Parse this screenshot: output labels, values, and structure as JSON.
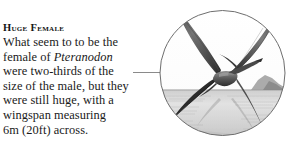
{
  "page": {
    "background_color": "#ffffff",
    "width": 287,
    "height": 150
  },
  "caption": {
    "heading": "Huge Female",
    "lines": [
      {
        "pre": "What seem to to be the",
        "species": "",
        "post": ""
      },
      {
        "pre": "female of ",
        "species": "Pteranodon",
        "post": ""
      },
      {
        "pre": "were two-thirds of the",
        "species": "",
        "post": ""
      },
      {
        "pre": "size of the male, but they",
        "species": "",
        "post": ""
      },
      {
        "pre": "were still huge, with a",
        "species": "",
        "post": ""
      },
      {
        "pre": "wingspan measuring",
        "species": "",
        "post": ""
      },
      {
        "pre": "6m (20ft) across.",
        "species": "",
        "post": ""
      }
    ],
    "full_text": "What seem to to be the female of Pteranodon were two-thirds of the size of the male, but they were still huge, with a wingspan measuring 6m (20ft) across.",
    "text_color": "#1a1a1a",
    "heading_color": "#141414"
  },
  "leader_line": {
    "color": "#8a8a8a"
  },
  "illustration": {
    "subject": "pteranodon-in-flight",
    "style": "grayscale-engraving-vignette",
    "shape": "circle",
    "scene_elements": [
      "pteranodon-gliding",
      "sea-surface",
      "horizon-line",
      "distant-headland",
      "sky"
    ],
    "colors": {
      "outline": "#6e6e6e",
      "sky": "#fdfdfd",
      "sea": "#dcdcdc",
      "sea_dark": "#b9b9b9",
      "creature_dark": "#1b1b1b",
      "creature_mid": "#6a6a6a",
      "creature_light": "#a8a8a8",
      "headland": "#8e8e8e"
    }
  }
}
